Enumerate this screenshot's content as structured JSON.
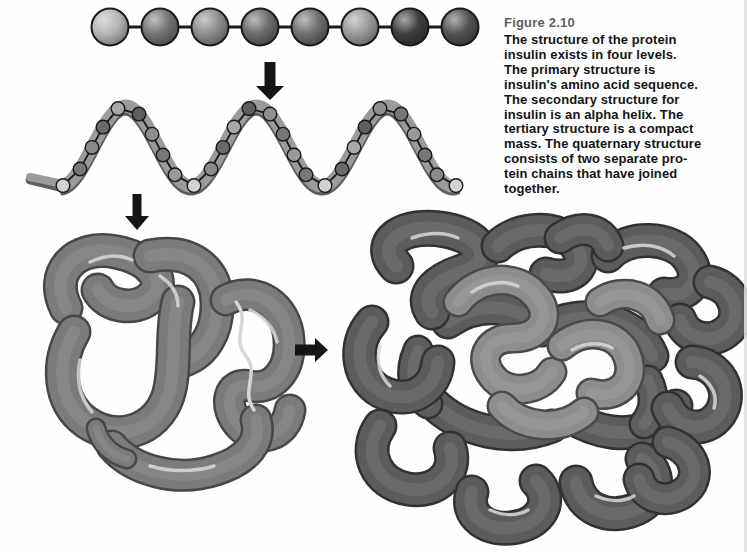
{
  "figure": {
    "label": "Figure 2.10",
    "caption": "The structure of the protein\ninsulin exists in four levels.\nThe primary structure is\ninsulin's amino acid sequence.\nThe secondary structure for\ninsulin is an alpha helix. The\ntertiary structure is a compact\nmass. The quaternary structure\nconsists of two separate pro-\ntein chains that have joined\ntogether.",
    "label_color": "#5f5f5f",
    "text_color": "#141414"
  },
  "icons": {
    "down-arrow-icon": "⬇",
    "right-arrow-icon": "➡"
  },
  "colors": {
    "background": "#fefefe",
    "arrow": "#161616",
    "bead_outline": "#1a1a1a",
    "connector": "#1a1a1a",
    "helix_ribbon": "#9b9b9b",
    "helix_ribbon_edge": "#5e5e5e",
    "tertiary_tube": "#7b7b7b",
    "tertiary_outline": "#474747",
    "tertiary_squiggle": "#d6d6d6",
    "quaternary_outer": "#5c5c5c",
    "quaternary_outer_outline": "#323232",
    "quaternary_inner": "#8d8d8d",
    "quaternary_inner_outline": "#4a4a4a",
    "highlight": "#d8d8d8",
    "edge_shadow": "#e2e2e2"
  },
  "primary_chain": {
    "bead_colors": [
      "#b5b5b5",
      "#747474",
      "#8d8d8d",
      "#6b6b6b",
      "#6e6e6e",
      "#9a9a9a",
      "#3e3e3e",
      "#525252"
    ]
  },
  "helix": {
    "bead_colors": [
      "#9a9a9a",
      "#787878",
      "#8a8a8a",
      "#6a6a6a",
      "#a8a8a8",
      "#5e5e5e",
      "#8f8f8f",
      "#767676"
    ],
    "trough_bead_color": "#d2d2d2"
  }
}
